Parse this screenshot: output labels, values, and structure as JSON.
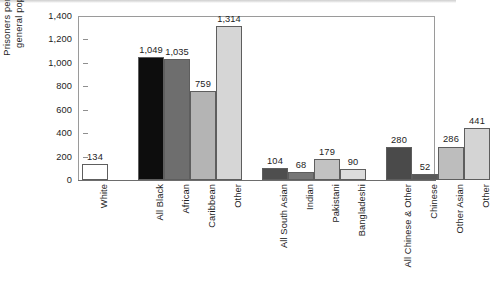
{
  "chart_data": {
    "type": "bar",
    "title": "",
    "xlabel": "",
    "ylabel": "Prisoners per 100,000\ngeneral population",
    "ylim": [
      0,
      1400
    ],
    "yticks": [
      0,
      200,
      400,
      600,
      800,
      1000,
      1200,
      1400
    ],
    "ytick_labels": [
      "0",
      "200",
      "400",
      "600",
      "800",
      "1,000",
      "1,200",
      "1,400"
    ],
    "grid": false,
    "legend": "none",
    "categories": [
      "White",
      "All Black",
      "African",
      "Caribbean",
      "Other",
      "All South Asian",
      "Indian",
      "Pakistani",
      "Bangladeshi",
      "All Chinese & Other",
      "Chinese",
      "Other Asian",
      "Other"
    ],
    "values": [
      134,
      1049,
      1035,
      759,
      1314,
      104,
      68,
      179,
      90,
      280,
      52,
      286,
      441
    ],
    "value_labels": [
      "134",
      "1,049",
      "1,035",
      "759",
      "1,314",
      "104",
      "68",
      "179",
      "90",
      "280",
      "52",
      "286",
      "441"
    ],
    "bar_colors": [
      "#ffffff",
      "#0d0d0d",
      "#6e6e6e",
      "#b4b4b4",
      "#d6d6d6",
      "#4e4e4e",
      "#767676",
      "#c2c2c2",
      "#dcdcdc",
      "#4a4a4a",
      "#585858",
      "#bdbdbd",
      "#d4d4d4"
    ],
    "groups": [
      {
        "name": "White",
        "members": [
          "White"
        ]
      },
      {
        "name": "Black",
        "members": [
          "All Black",
          "African",
          "Caribbean",
          "Other"
        ]
      },
      {
        "name": "South Asian",
        "members": [
          "All South Asian",
          "Indian",
          "Pakistani",
          "Bangladeshi"
        ]
      },
      {
        "name": "Chinese & Other",
        "members": [
          "All Chinese & Other",
          "Chinese",
          "Other Asian",
          "Other"
        ]
      }
    ]
  }
}
